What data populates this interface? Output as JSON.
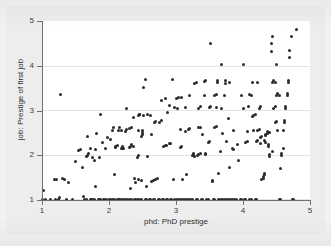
{
  "chart_data": {
    "type": "scatter",
    "title": "",
    "xlabel": "phd: PhD prestige",
    "ylabel": "job: Prestige of first job",
    "xlim": [
      1,
      5
    ],
    "ylim": [
      1,
      5
    ],
    "xticks": [
      1,
      2,
      3,
      4,
      5
    ],
    "yticks": [
      1,
      2,
      3,
      4,
      5
    ],
    "xtick_labels": [
      "1",
      "2",
      "3",
      "4",
      "5"
    ],
    "ytick_labels": [
      "1",
      "2",
      "3",
      "4",
      "5"
    ],
    "grid": "horizontal",
    "legend": "none",
    "marker": "filled-circle",
    "marker_color": "#2b2b2b",
    "plot_background": "#ffffff",
    "figure_background": "#ededed",
    "gridline_color": "#e3e3e3",
    "axis_color": "#6f6f6f",
    "n_points": 308,
    "points": [
      [
        1.0,
        1.01
      ],
      [
        1.02,
        1.22
      ],
      [
        1.05,
        1.01
      ],
      [
        1.12,
        1.01
      ],
      [
        1.18,
        1.45
      ],
      [
        1.22,
        1.45
      ],
      [
        1.2,
        1.01
      ],
      [
        1.24,
        1.01
      ],
      [
        1.26,
        1.05
      ],
      [
        1.27,
        3.35
      ],
      [
        1.3,
        1.48
      ],
      [
        1.33,
        1.46
      ],
      [
        1.36,
        1.01
      ],
      [
        1.4,
        1.4
      ],
      [
        1.45,
        1.01
      ],
      [
        1.5,
        1.85
      ],
      [
        1.55,
        2.1
      ],
      [
        1.58,
        2.12
      ],
      [
        1.6,
        1.72
      ],
      [
        1.62,
        1.08
      ],
      [
        1.64,
        1.01
      ],
      [
        1.66,
        1.01
      ],
      [
        1.66,
        1.98
      ],
      [
        1.68,
        2.0
      ],
      [
        1.7,
        2.05
      ],
      [
        1.72,
        1.01
      ],
      [
        1.74,
        1.01
      ],
      [
        1.76,
        1.01
      ],
      [
        1.78,
        1.01
      ],
      [
        1.8,
        1.3
      ],
      [
        1.78,
        1.88
      ],
      [
        1.8,
        2.12
      ],
      [
        1.82,
        2.48
      ],
      [
        1.84,
        1.01
      ],
      [
        1.86,
        1.01
      ],
      [
        1.88,
        1.01
      ],
      [
        1.86,
        1.95
      ],
      [
        1.88,
        2.9
      ],
      [
        1.9,
        2.28
      ],
      [
        1.92,
        1.01
      ],
      [
        1.94,
        1.01
      ],
      [
        1.96,
        1.01
      ],
      [
        1.95,
        2.16
      ],
      [
        1.98,
        2.4
      ],
      [
        2.0,
        1.01
      ],
      [
        2.02,
        1.01
      ],
      [
        2.02,
        2.35
      ],
      [
        2.05,
        2.55
      ],
      [
        2.05,
        1.01
      ],
      [
        2.08,
        1.01
      ],
      [
        2.08,
        1.58
      ],
      [
        2.1,
        2.18
      ],
      [
        2.1,
        2.2
      ],
      [
        2.12,
        2.22
      ],
      [
        2.12,
        1.01
      ],
      [
        2.14,
        1.01
      ],
      [
        2.14,
        2.55
      ],
      [
        2.15,
        2.62
      ],
      [
        2.16,
        1.01
      ],
      [
        2.18,
        1.01
      ],
      [
        2.18,
        2.14
      ],
      [
        2.2,
        2.18
      ],
      [
        2.2,
        2.2
      ],
      [
        2.22,
        2.16
      ],
      [
        2.22,
        1.01
      ],
      [
        2.24,
        1.01
      ],
      [
        2.25,
        2.52
      ],
      [
        2.26,
        2.58
      ],
      [
        2.26,
        3.04
      ],
      [
        2.28,
        1.01
      ],
      [
        2.3,
        1.01
      ],
      [
        2.3,
        2.18
      ],
      [
        2.32,
        2.2
      ],
      [
        2.32,
        1.26
      ],
      [
        2.34,
        1.01
      ],
      [
        2.34,
        2.62
      ],
      [
        2.36,
        2.85
      ],
      [
        2.38,
        1.01
      ],
      [
        2.38,
        1.48
      ],
      [
        2.4,
        1.4
      ],
      [
        2.4,
        1.01
      ],
      [
        2.42,
        1.01
      ],
      [
        2.42,
        1.95
      ],
      [
        2.44,
        2.0
      ],
      [
        2.44,
        2.88
      ],
      [
        2.45,
        2.92
      ],
      [
        2.46,
        2.9
      ],
      [
        2.46,
        1.01
      ],
      [
        2.48,
        1.01
      ],
      [
        2.48,
        2.42
      ],
      [
        2.5,
        2.46
      ],
      [
        2.5,
        2.5
      ],
      [
        2.5,
        2.55
      ],
      [
        2.52,
        2.88
      ],
      [
        2.52,
        3.52
      ],
      [
        2.54,
        3.7
      ],
      [
        2.54,
        1.01
      ],
      [
        2.56,
        1.01
      ],
      [
        2.56,
        1.3
      ],
      [
        2.58,
        1.98
      ],
      [
        2.58,
        2.92
      ],
      [
        2.6,
        1.01
      ],
      [
        2.62,
        1.01
      ],
      [
        2.62,
        2.88
      ],
      [
        2.64,
        2.46
      ],
      [
        2.66,
        1.01
      ],
      [
        2.68,
        1.01
      ],
      [
        2.68,
        2.74
      ],
      [
        2.7,
        2.76
      ],
      [
        2.7,
        1.46
      ],
      [
        2.72,
        1.48
      ],
      [
        2.74,
        1.01
      ],
      [
        2.76,
        1.01
      ],
      [
        2.76,
        2.74
      ],
      [
        2.78,
        2.78
      ],
      [
        2.78,
        3.22
      ],
      [
        2.8,
        1.01
      ],
      [
        2.82,
        1.01
      ],
      [
        2.82,
        2.2
      ],
      [
        2.84,
        2.22
      ],
      [
        2.84,
        3.26
      ],
      [
        2.86,
        1.01
      ],
      [
        2.88,
        1.01
      ],
      [
        2.88,
        2.95
      ],
      [
        2.9,
        3.12
      ],
      [
        2.9,
        2.26
      ],
      [
        2.92,
        1.01
      ],
      [
        2.94,
        1.01
      ],
      [
        2.95,
        3.7
      ],
      [
        2.96,
        1.46
      ],
      [
        2.98,
        1.01
      ],
      [
        3.0,
        1.01
      ],
      [
        3.0,
        3.26
      ],
      [
        3.02,
        3.05
      ],
      [
        3.04,
        1.01
      ],
      [
        3.06,
        1.01
      ],
      [
        3.06,
        2.58
      ],
      [
        3.08,
        3.28
      ],
      [
        3.1,
        1.46
      ],
      [
        3.1,
        1.01
      ],
      [
        3.12,
        1.01
      ],
      [
        3.14,
        2.52
      ],
      [
        3.14,
        3.06
      ],
      [
        3.16,
        1.01
      ],
      [
        3.18,
        1.01
      ],
      [
        3.18,
        2.58
      ],
      [
        3.2,
        2.6
      ],
      [
        3.2,
        3.34
      ],
      [
        3.22,
        1.01
      ],
      [
        3.24,
        1.01
      ],
      [
        3.24,
        2.0
      ],
      [
        3.26,
        2.02
      ],
      [
        3.26,
        2.05
      ],
      [
        3.28,
        1.98
      ],
      [
        3.28,
        3.6
      ],
      [
        3.3,
        3.62
      ],
      [
        3.3,
        1.01
      ],
      [
        3.32,
        1.01
      ],
      [
        3.32,
        2.0
      ],
      [
        3.34,
        2.02
      ],
      [
        3.34,
        3.05
      ],
      [
        3.36,
        3.08
      ],
      [
        3.36,
        2.62
      ],
      [
        3.38,
        1.01
      ],
      [
        3.4,
        1.01
      ],
      [
        3.4,
        2.46
      ],
      [
        3.42,
        3.34
      ],
      [
        3.42,
        3.64
      ],
      [
        3.44,
        3.66
      ],
      [
        3.44,
        2.04
      ],
      [
        3.46,
        1.01
      ],
      [
        3.48,
        1.01
      ],
      [
        3.48,
        2.28
      ],
      [
        3.5,
        2.3
      ],
      [
        3.5,
        3.06
      ],
      [
        3.52,
        3.08
      ],
      [
        3.52,
        4.5
      ],
      [
        3.54,
        1.42
      ],
      [
        3.54,
        1.44
      ],
      [
        3.56,
        1.01
      ],
      [
        3.58,
        1.01
      ],
      [
        3.58,
        2.62
      ],
      [
        3.6,
        2.64
      ],
      [
        3.6,
        3.36
      ],
      [
        3.62,
        3.62
      ],
      [
        3.62,
        3.66
      ],
      [
        3.64,
        1.6
      ],
      [
        3.64,
        1.01
      ],
      [
        3.66,
        1.01
      ],
      [
        3.66,
        2.08
      ],
      [
        3.68,
        3.05
      ],
      [
        3.68,
        4.02
      ],
      [
        3.7,
        2.48
      ],
      [
        3.7,
        1.01
      ],
      [
        3.72,
        1.01
      ],
      [
        3.72,
        3.34
      ],
      [
        3.74,
        3.6
      ],
      [
        3.74,
        3.66
      ],
      [
        3.76,
        2.3
      ],
      [
        3.76,
        1.01
      ],
      [
        3.78,
        1.01
      ],
      [
        3.78,
        2.82
      ],
      [
        3.8,
        3.62
      ],
      [
        3.8,
        1.72
      ],
      [
        3.82,
        1.01
      ],
      [
        3.84,
        1.01
      ],
      [
        3.84,
        2.14
      ],
      [
        3.86,
        2.55
      ],
      [
        3.88,
        1.01
      ],
      [
        3.9,
        1.01
      ],
      [
        3.92,
        2.24
      ],
      [
        3.94,
        1.88
      ],
      [
        3.96,
        1.01
      ],
      [
        3.98,
        1.01
      ],
      [
        3.98,
        3.34
      ],
      [
        4.0,
        3.05
      ],
      [
        4.0,
        4.02
      ],
      [
        4.02,
        1.01
      ],
      [
        4.04,
        1.01
      ],
      [
        4.04,
        2.28
      ],
      [
        4.06,
        2.3
      ],
      [
        4.08,
        3.08
      ],
      [
        4.1,
        1.01
      ],
      [
        4.12,
        1.01
      ],
      [
        4.12,
        3.34
      ],
      [
        4.14,
        2.86
      ],
      [
        4.16,
        2.55
      ],
      [
        4.18,
        1.01
      ],
      [
        4.2,
        1.01
      ],
      [
        4.2,
        2.3
      ],
      [
        4.22,
        2.32
      ],
      [
        4.22,
        2.55
      ],
      [
        4.24,
        2.58
      ],
      [
        4.24,
        3.05
      ],
      [
        4.26,
        3.08
      ],
      [
        4.26,
        2.4
      ],
      [
        4.28,
        2.42
      ],
      [
        4.28,
        1.45
      ],
      [
        4.3,
        1.48
      ],
      [
        4.3,
        1.52
      ],
      [
        4.32,
        1.56
      ],
      [
        4.32,
        1.6
      ],
      [
        4.34,
        2.44
      ],
      [
        4.34,
        2.46
      ],
      [
        4.36,
        2.48
      ],
      [
        4.36,
        2.52
      ],
      [
        4.38,
        2.2
      ],
      [
        4.38,
        2.24
      ],
      [
        4.4,
        1.98
      ],
      [
        4.4,
        2.02
      ],
      [
        4.42,
        4.32
      ],
      [
        4.42,
        4.5
      ],
      [
        4.44,
        4.66
      ],
      [
        4.44,
        3.62
      ],
      [
        4.46,
        3.66
      ],
      [
        4.46,
        3.05
      ],
      [
        4.48,
        3.08
      ],
      [
        4.48,
        2.74
      ],
      [
        4.5,
        2.76
      ],
      [
        4.5,
        3.34
      ],
      [
        4.52,
        3.38
      ],
      [
        4.52,
        2.55
      ],
      [
        4.54,
        1.01
      ],
      [
        4.56,
        1.01
      ],
      [
        4.56,
        1.7
      ],
      [
        4.58,
        2.0
      ],
      [
        4.58,
        2.05
      ],
      [
        4.6,
        2.15
      ],
      [
        4.6,
        2.56
      ],
      [
        4.62,
        2.74
      ],
      [
        4.62,
        2.78
      ],
      [
        4.64,
        3.05
      ],
      [
        4.64,
        3.08
      ],
      [
        4.66,
        3.34
      ],
      [
        4.66,
        3.38
      ],
      [
        4.68,
        3.62
      ],
      [
        4.68,
        3.66
      ],
      [
        4.7,
        4.18
      ],
      [
        4.7,
        4.34
      ],
      [
        4.72,
        4.66
      ],
      [
        4.74,
        1.01
      ],
      [
        4.76,
        1.01
      ],
      [
        4.8,
        4.82
      ],
      [
        2.64,
        1.42
      ],
      [
        2.66,
        1.44
      ],
      [
        3.16,
        1.58
      ],
      [
        2.3,
        2.6
      ],
      [
        2.34,
        2.24
      ],
      [
        2.36,
        2.2
      ],
      [
        2.44,
        2.55
      ],
      [
        2.2,
        2.14
      ],
      [
        2.18,
        2.55
      ],
      [
        1.68,
        2.42
      ],
      [
        1.72,
        2.14
      ],
      [
        1.76,
        1.96
      ],
      [
        2.06,
        2.62
      ],
      [
        2.44,
        1.46
      ],
      [
        2.48,
        1.44
      ],
      [
        3.06,
        2.18
      ],
      [
        3.08,
        2.2
      ],
      [
        3.34,
        2.62
      ],
      [
        3.36,
        2.04
      ],
      [
        3.44,
        2.02
      ],
      [
        3.86,
        2.12
      ],
      [
        4.06,
        2.52
      ],
      [
        4.16,
        2.88
      ],
      [
        4.18,
        2.9
      ],
      [
        4.26,
        2.26
      ],
      [
        4.32,
        2.34
      ],
      [
        4.34,
        2.28
      ],
      [
        4.4,
        2.5
      ],
      [
        4.44,
        2.08
      ],
      [
        2.86,
        2.22
      ],
      [
        2.92,
        2.26
      ],
      [
        3.58,
        3.34
      ],
      [
        3.6,
        3.06
      ],
      [
        2.98,
        3.06
      ],
      [
        3.04,
        3.3
      ],
      [
        4.1,
        3.36
      ],
      [
        4.14,
        3.62
      ],
      [
        4.22,
        3.62
      ],
      [
        4.48,
        3.62
      ],
      [
        4.5,
        4.02
      ],
      [
        4.54,
        3.34
      ]
    ]
  },
  "axis": {
    "y_ticks": [
      "5",
      "4",
      "3",
      "2",
      "1"
    ],
    "x_ticks": [
      "1",
      "2",
      "3",
      "4",
      "5"
    ]
  }
}
